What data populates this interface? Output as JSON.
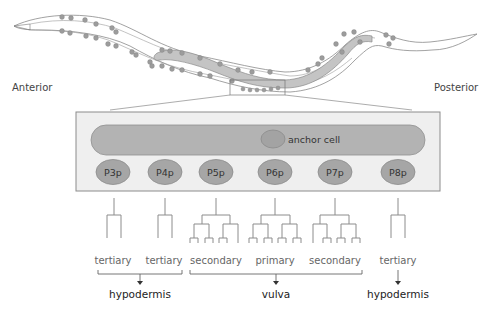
{
  "diagram": {
    "type": "C. elegans vulval precursor cell lineage",
    "orientation": {
      "left_label": "Anterior",
      "right_label": "Posterior"
    },
    "worm": {
      "description": "hermaphrodite worm outline with gonad and nuclei",
      "zoom_box": "vulval region"
    },
    "gonad": {
      "anchor_cell_label": "anchor cell"
    },
    "cells": [
      {
        "id": "P3p",
        "label": "P3p",
        "fate": "tertiary",
        "x": 113
      },
      {
        "id": "P4p",
        "label": "P4p",
        "fate": "tertiary",
        "x": 165
      },
      {
        "id": "P5p",
        "label": "P5p",
        "fate": "secondary",
        "x": 216
      },
      {
        "id": "P6p",
        "label": "P6p",
        "fate": "primary",
        "x": 275
      },
      {
        "id": "P7p",
        "label": "P7p",
        "fate": "secondary",
        "x": 335
      },
      {
        "id": "P8p",
        "label": "P8p",
        "fate": "tertiary",
        "x": 398
      }
    ],
    "fates": {
      "p3p": "tertiary",
      "p4p": "tertiary",
      "p5p": "secondary",
      "p6p": "primary",
      "p7p": "secondary",
      "p8p": "tertiary"
    },
    "outcomes": {
      "left": "hypodermis",
      "center": "vulva",
      "right": "hypodermis"
    },
    "colors": {
      "cell_fill": "#a6a6a6",
      "cell_stroke": "#8a8a8a",
      "gonad_fill": "#b3b3b3",
      "box_fill": "#efefef",
      "line": "#8c8c8c"
    }
  }
}
